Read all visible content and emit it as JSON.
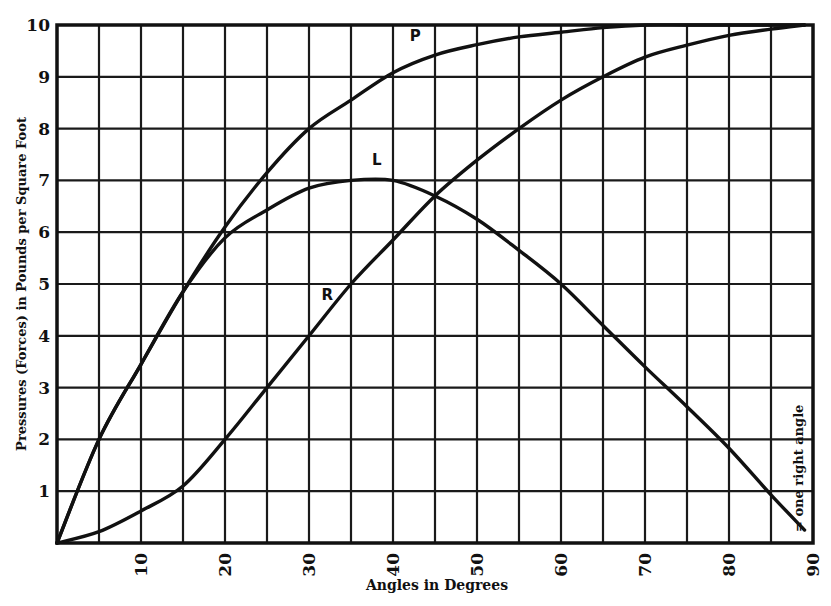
{
  "chart_data": {
    "type": "line",
    "title": "",
    "xlabel": "Angles in Degrees",
    "ylabel": "Pressures (Forces) in Pounds per Square Foot",
    "xlim": [
      0,
      90
    ],
    "ylim": [
      0,
      10
    ],
    "x_ticks": [
      10,
      20,
      30,
      40,
      50,
      60,
      70,
      80,
      90
    ],
    "y_ticks": [
      1,
      2,
      3,
      4,
      5,
      6,
      7,
      8,
      9,
      10
    ],
    "grid": {
      "x_step": 5,
      "y_step": 1,
      "on": true
    },
    "annotation": "= one right angle",
    "x": [
      0,
      5,
      10,
      15,
      20,
      25,
      30,
      35,
      40,
      45,
      50,
      55,
      60,
      65,
      70,
      75,
      80,
      85,
      89
    ],
    "series": [
      {
        "name": "P",
        "label_pos": [
          42,
          9.7
        ],
        "values": [
          0,
          2.0,
          3.45,
          4.85,
          6.1,
          7.15,
          8.0,
          8.55,
          9.08,
          9.42,
          9.62,
          9.77,
          9.86,
          9.95,
          10.0,
          10.0,
          10.0,
          10.0,
          10.0
        ]
      },
      {
        "name": "L",
        "label_pos": [
          37.5,
          7.3
        ],
        "values": [
          0,
          2.0,
          3.45,
          4.85,
          5.89,
          6.43,
          6.85,
          7.0,
          7.0,
          6.7,
          6.25,
          5.65,
          5.0,
          4.2,
          3.4,
          2.63,
          1.83,
          0.93,
          0.25
        ]
      },
      {
        "name": "R",
        "label_pos": [
          31.5,
          4.7
        ],
        "values": [
          0,
          0.22,
          0.62,
          1.1,
          2.0,
          3.0,
          4.0,
          5.0,
          5.85,
          6.7,
          7.39,
          8.0,
          8.55,
          9.0,
          9.38,
          9.61,
          9.8,
          9.92,
          10.0
        ]
      }
    ]
  }
}
